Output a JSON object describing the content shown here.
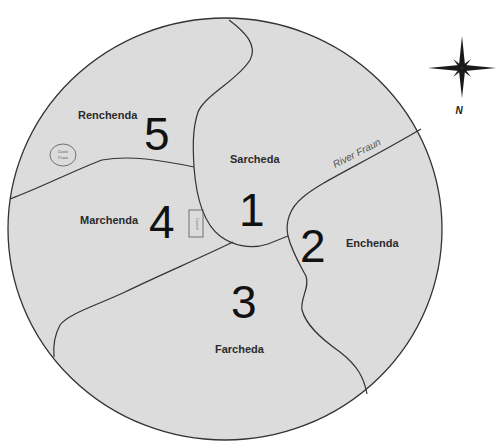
{
  "map": {
    "background_color": "#ffffff",
    "land_color": "#dcdcdc",
    "line_color": "#333333",
    "regions": [
      {
        "number": "1",
        "name": "Sarcheda"
      },
      {
        "number": "2",
        "name": "Enchenda"
      },
      {
        "number": "3",
        "name": "Farcheda"
      },
      {
        "number": "4",
        "name": "Marchenda"
      },
      {
        "number": "5",
        "name": "Renchenda"
      }
    ],
    "river": {
      "label": "River Fraun"
    },
    "landmarks": {
      "castle": {
        "label_line1": "Castle",
        "label_line2": "Fraun"
      },
      "council": {
        "label": "Council"
      }
    },
    "compass": {
      "icon": "compass-rose-icon",
      "north_label": "N"
    }
  }
}
